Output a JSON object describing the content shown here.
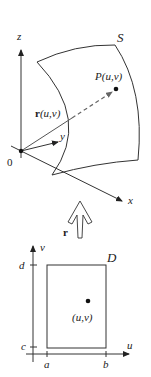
{
  "diagram": {
    "colors": {
      "stroke": "#333333",
      "text": "#222222",
      "dashed_vector": "#777777",
      "background": "#ffffff"
    },
    "upper_3d": {
      "axes": {
        "z": "z",
        "y": "y",
        "x": "x",
        "origin": "0"
      },
      "surface_label": "S",
      "point_label": "P(u,v)",
      "position_vector_label_bold": "r",
      "position_vector_label_args": "(u,v)"
    },
    "mapping_arrow": {
      "label": "r"
    },
    "lower_2d": {
      "axes": {
        "horizontal": "u",
        "vertical": "v"
      },
      "domain_label": "D",
      "ticks": {
        "u_left": "a",
        "u_right": "b",
        "v_bottom": "c",
        "v_top": "d"
      },
      "point_label": "(u,v)"
    }
  }
}
